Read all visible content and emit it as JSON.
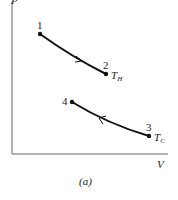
{
  "axes": {
    "y_label": "P",
    "x_label": "V"
  },
  "points": [
    {
      "label": "1",
      "x": 40,
      "y": 34
    },
    {
      "label": "2",
      "x": 106,
      "y": 74
    },
    {
      "label": "3",
      "x": 149,
      "y": 136
    },
    {
      "label": "4",
      "x": 72,
      "y": 102
    }
  ],
  "isotherms": {
    "hot": {
      "label": "T",
      "sub": "H",
      "from": "1",
      "to": "2",
      "direction": "1→2"
    },
    "cold": {
      "label": "T",
      "sub": "C",
      "from": "3",
      "to": "4",
      "direction": "3→4"
    }
  },
  "caption": "(a)",
  "colors": {
    "line": "#111111",
    "axis": "#555555"
  }
}
